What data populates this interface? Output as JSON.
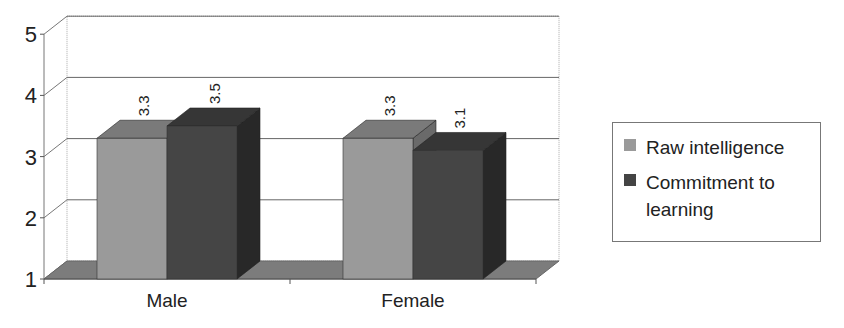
{
  "chart_data": {
    "type": "bar",
    "subtype": "3d-clustered-column",
    "title": "",
    "xlabel": "",
    "ylabel": "",
    "categories": [
      "Male",
      "Female"
    ],
    "series": [
      {
        "name": "Raw intelligence",
        "values": [
          3.3,
          3.3
        ],
        "color": "#9a9a9a"
      },
      {
        "name": "Commitment to learning",
        "values": [
          3.5,
          3.1
        ],
        "color": "#444444"
      }
    ],
    "data_labels": [
      [
        "3.3",
        "3.3"
      ],
      [
        "3.5",
        "3.1"
      ]
    ],
    "yticks": [
      "1",
      "2",
      "3",
      "4",
      "5"
    ],
    "ylim": [
      1,
      5
    ],
    "grid": true,
    "legend_position": "right"
  },
  "legend": {
    "items": [
      {
        "label": "Raw intelligence",
        "color": "#9a9a9a"
      },
      {
        "label": "Commitment to learning",
        "color": "#444444"
      }
    ]
  }
}
